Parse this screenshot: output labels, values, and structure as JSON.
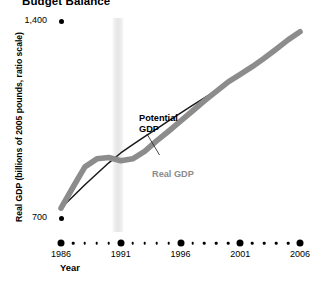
{
  "title": "Budget Balance",
  "axes": {
    "y_title": "Real GDP (billions of 2005 pounds, ratio scale)",
    "x_title": "Year",
    "y_ticks": [
      {
        "label": "1,400",
        "value": 1400
      },
      {
        "label": "700",
        "value": 700
      }
    ],
    "x_ticks": [
      {
        "label": "1986",
        "value": 1986
      },
      {
        "label": "1991",
        "value": 1991
      },
      {
        "label": "1996",
        "value": 1996
      },
      {
        "label": "2001",
        "value": 2001
      },
      {
        "label": "2006",
        "value": 2006
      }
    ]
  },
  "annotations": {
    "potential_gdp": "Potential\nGDP",
    "potential_gdp_line1": "Potential",
    "potential_gdp_line2": "GDP",
    "real_gdp": "Real GDP"
  },
  "colors": {
    "real_gdp": "#8c8c8c",
    "potential_gdp": "#1a1a1a",
    "recession_band": "#e6e6e6",
    "axis": "#000000",
    "background": "#ffffff"
  },
  "chart_data": {
    "type": "line",
    "title": "Budget Balance",
    "xlabel": "Year",
    "ylabel": "Real GDP (billions of 2005 pounds, ratio scale)",
    "scale": "ratio (logarithmic) y-axis",
    "xlim": [
      1986,
      2006
    ],
    "ylim": [
      700,
      1400
    ],
    "grid": false,
    "legend": "inline annotations",
    "recession_band": {
      "start": 1990.3,
      "end": 1991.3,
      "label": "recession"
    },
    "x": [
      1986,
      1987,
      1988,
      1989,
      1990,
      1991,
      1992,
      1993,
      1994,
      1995,
      1996,
      1997,
      1998,
      1999,
      2000,
      2001,
      2002,
      2003,
      2004,
      2005,
      2006
    ],
    "series": [
      {
        "name": "Real GDP",
        "values": [
          725,
          780,
          838,
          862,
          866,
          856,
          862,
          885,
          918,
          950,
          984,
          1020,
          1057,
          1093,
          1130,
          1160,
          1192,
          1228,
          1268,
          1310,
          1348
        ]
      },
      {
        "name": "Potential GDP",
        "values": [
          725,
          755,
          787,
          818,
          850,
          880,
          906,
          932,
          958,
          985,
          1012,
          1040,
          1068,
          1097,
          1126,
          1156,
          1188,
          1222,
          1262,
          1305,
          1345
        ]
      }
    ]
  }
}
